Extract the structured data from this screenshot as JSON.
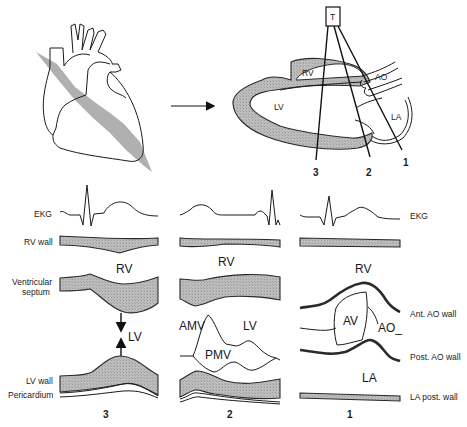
{
  "top": {
    "heart_illustration": {
      "description": "Anterior view of heart with oblique long-axis cutting plane"
    },
    "arrow": "right-arrow",
    "long_axis_section": {
      "transducer_label": "T",
      "chambers": {
        "rv": "RV",
        "lv": "LV",
        "ao": "AO",
        "la": "LA"
      },
      "beam_labels": [
        "3",
        "2",
        "1"
      ]
    }
  },
  "left_labels": {
    "ekg": "EKG",
    "rv_wall": "RV wall",
    "ventricular_septum_line1": "Ventricular",
    "ventricular_septum_line2": "septum",
    "lv_wall": "LV wall",
    "pericardium": "Pericardium"
  },
  "right_labels": {
    "ekg": "EKG",
    "ant_ao_wall": "Ant. AO wall",
    "post_ao_wall": "Post. AO wall",
    "la_post_wall": "LA post. wall"
  },
  "panels": [
    {
      "id": "3",
      "label": "3",
      "cavity_labels": {
        "rv": "RV",
        "lv": "LV"
      }
    },
    {
      "id": "2",
      "label": "2",
      "cavity_labels": {
        "rv": "RV",
        "lv": "LV",
        "amv": "AMV",
        "pmv": "PMV"
      }
    },
    {
      "id": "1",
      "label": "1",
      "cavity_labels": {
        "rv": "RV",
        "av": "AV",
        "ao": "AO_",
        "la": "LA"
      }
    }
  ],
  "colors": {
    "line": "#1a1a1a",
    "tissue_fill": "#b4b4b4",
    "background": "#ffffff"
  }
}
